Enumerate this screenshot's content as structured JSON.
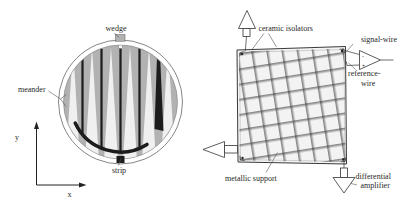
{
  "figure_left": {
    "labels": {
      "wedge": "wedge",
      "meander": "meander",
      "strip": "strip",
      "axis_x": "x",
      "axis_y": "y"
    },
    "colors": {
      "disc_gray": "#b2b2b2",
      "wedge_light": "#f0f0f0",
      "electrode_dark": "#1c1c1c",
      "outline": "#555555"
    }
  },
  "figure_right": {
    "labels": {
      "ceramic_isolators": "ceramic isolators",
      "signal_wire": "signal-wire",
      "reference_wire_line1": "reference-",
      "reference_wire_line2": "wire",
      "metallic_support": "metallic support",
      "differential_amplifier_line1": "differential",
      "differential_amplifier_line2": "amplifier",
      "amp_minus": "-",
      "amp_plus": "+"
    },
    "colors": {
      "frame_fill": "#f3f3f3",
      "wire_dark": "#2f2f2f"
    }
  }
}
